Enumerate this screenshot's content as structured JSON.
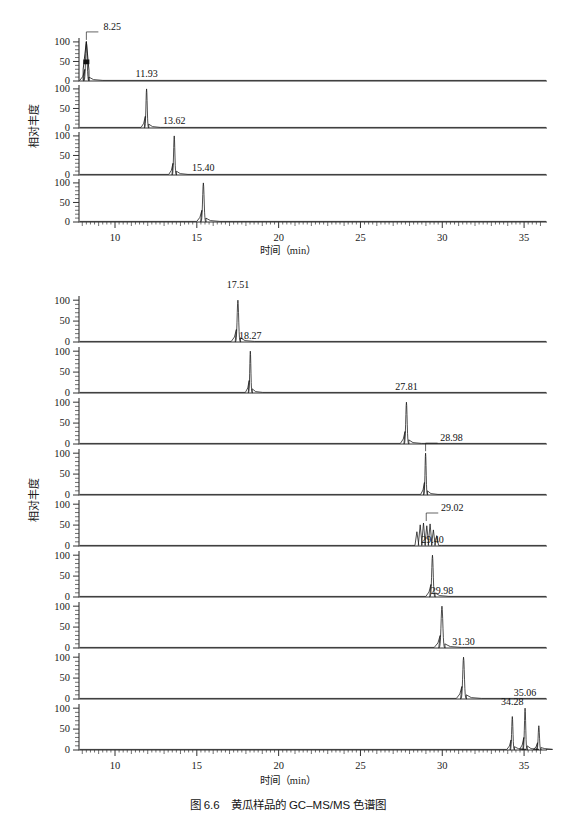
{
  "figure": {
    "caption": "图 6.6　黄瓜样品的 GC–MS/MS 色谱图",
    "y_axis_label": "相对丰度",
    "x_axis_label": "时间（min）",
    "x_axis_label_top": "时间（min）",
    "y_ticks": [
      "100",
      "50",
      "0"
    ],
    "x_ticks": [
      "10",
      "15",
      "20",
      "25",
      "30",
      "35"
    ]
  },
  "chart_data": {
    "type": "line",
    "title": "图 6.6　黄瓜样品的 GC–MS/MS 色谱图",
    "xlabel": "时间（min）",
    "ylabel": "相对丰度",
    "xlim": [
      7.8,
      36.4
    ],
    "ylim": [
      0,
      110
    ],
    "grid": false,
    "legend": "none",
    "groups": [
      {
        "name": "upper-group",
        "panel_count": 4,
        "x_ticks": [
          10,
          15,
          20,
          25,
          30,
          35
        ],
        "panels": [
          {
            "index": 1,
            "labels": [
              "8.25"
            ],
            "peaks": [
              {
                "rt": 8.25,
                "height": 100,
                "width": 0.12,
                "label": "8.25",
                "label_leader": true,
                "shoulder": 55
              }
            ]
          },
          {
            "index": 2,
            "labels": [
              "11.93"
            ],
            "peaks": [
              {
                "rt": 11.93,
                "height": 100,
                "width": 0.1,
                "label": "11.93",
                "label_leader": false
              }
            ]
          },
          {
            "index": 3,
            "labels": [
              "13.62"
            ],
            "peaks": [
              {
                "rt": 13.62,
                "height": 100,
                "width": 0.1,
                "label": "13.62",
                "label_leader": false
              }
            ]
          },
          {
            "index": 4,
            "labels": [
              "15.40"
            ],
            "peaks": [
              {
                "rt": 15.4,
                "height": 100,
                "width": 0.12,
                "label": "15.40",
                "label_leader": false
              }
            ]
          }
        ]
      },
      {
        "name": "lower-group",
        "panel_count": 8,
        "x_ticks": [
          10,
          15,
          20,
          25,
          30,
          35
        ],
        "panels": [
          {
            "index": 1,
            "labels": [
              "17.51"
            ],
            "peaks": [
              {
                "rt": 17.51,
                "height": 100,
                "width": 0.12,
                "label": "17.51",
                "label_leader": false
              }
            ]
          },
          {
            "index": 2,
            "labels": [
              "18.27"
            ],
            "peaks": [
              {
                "rt": 18.27,
                "height": 100,
                "width": 0.09,
                "label": "18.27",
                "label_leader": false
              }
            ]
          },
          {
            "index": 3,
            "labels": [
              "27.81"
            ],
            "peaks": [
              {
                "rt": 27.81,
                "height": 100,
                "width": 0.11,
                "label": "27.81",
                "label_leader": false
              }
            ]
          },
          {
            "index": 4,
            "labels": [
              "28.98"
            ],
            "peaks": [
              {
                "rt": 28.98,
                "height": 100,
                "width": 0.09,
                "label": "28.98",
                "label_leader": true
              }
            ]
          },
          {
            "index": 5,
            "labels": [
              "29.02"
            ],
            "peaks": [
              {
                "rt": 29.02,
                "height": 55,
                "width": 0.3,
                "label": "29.02",
                "label_leader": true,
                "cluster": true
              }
            ]
          },
          {
            "index": 6,
            "labels": [
              "29.40"
            ],
            "peaks": [
              {
                "rt": 29.4,
                "height": 100,
                "width": 0.12,
                "label": "29.40",
                "label_leader": false
              }
            ]
          },
          {
            "index": 7,
            "labels": [
              "29.98"
            ],
            "peaks": [
              {
                "rt": 29.98,
                "height": 100,
                "width": 0.14,
                "label": "29.98",
                "label_leader": false
              }
            ]
          },
          {
            "index": 8,
            "labels": [
              "31.30"
            ],
            "peaks": [
              {
                "rt": 31.3,
                "height": 100,
                "width": 0.13,
                "label": "31.30",
                "label_leader": false
              }
            ]
          },
          {
            "index": 9,
            "labels": [
              "34.28",
              "35.06"
            ],
            "peaks": [
              {
                "rt": 34.28,
                "height": 80,
                "width": 0.1,
                "label": "34.28",
                "label_leader": false
              },
              {
                "rt": 35.06,
                "height": 100,
                "width": 0.1,
                "label": "35.06",
                "label_leader": false
              },
              {
                "rt": 35.9,
                "height": 58,
                "width": 0.1,
                "label": "",
                "label_leader": false
              }
            ]
          }
        ]
      }
    ]
  }
}
